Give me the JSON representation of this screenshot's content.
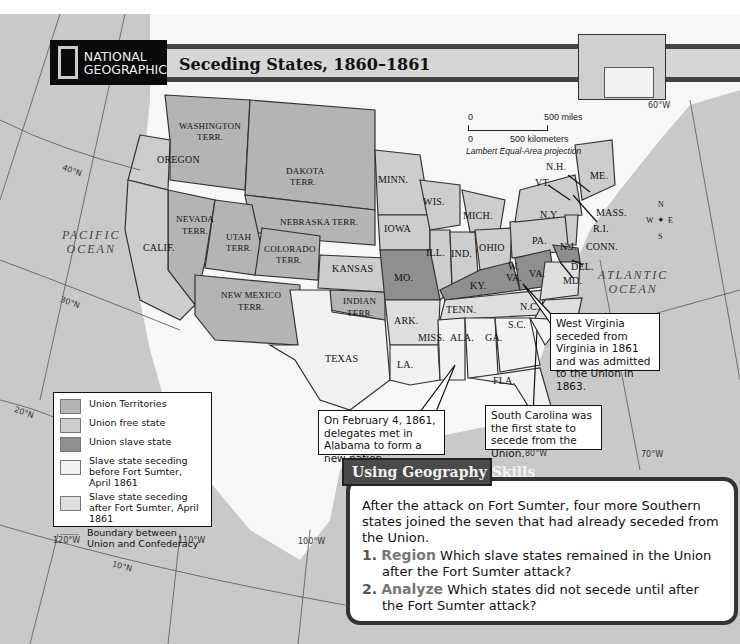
{
  "header": {
    "publisher_line1": "NATIONAL",
    "publisher_line2": "GEOGRAPHIC",
    "title": "Seceding States, 1860–1861"
  },
  "scale_bar": {
    "miles_start": "0",
    "miles_end": "500 miles",
    "km_start": "0",
    "km_end": "500 kilometers",
    "projection": "Lambert Equal-Area projection"
  },
  "compass": {
    "n": "N",
    "s": "S",
    "e": "E",
    "w": "W"
  },
  "oceans": {
    "pacific_line1": "PACIFIC",
    "pacific_line2": "OCEAN",
    "atlantic_line1": "ATLANTIC",
    "atlantic_line2": "OCEAN"
  },
  "gridlines": {
    "lat_40": "40°N",
    "lat_30": "30°N",
    "lat_20": "20°N",
    "lat_10": "10°N",
    "lon_120": "120°W",
    "lon_110": "110°W",
    "lon_100": "100°W",
    "lon_90": "90°W",
    "lon_80": "80°W",
    "lon_70": "70°W",
    "lon_60": "60°W"
  },
  "regions": {
    "washington_1": "WASHINGTON",
    "washington_2": "TERR.",
    "oregon": "OREGON",
    "dakota_1": "DAKOTA",
    "dakota_2": "TERR.",
    "nebraska": "NEBRASKA TERR.",
    "nevada_1": "NEVADA",
    "nevada_2": "TERR.",
    "utah_1": "UTAH",
    "utah_2": "TERR.",
    "colorado_1": "COLORADO",
    "colorado_2": "TERR.",
    "calif": "CALIF.",
    "kansas": "KANSAS",
    "newmexico_1": "NEW MEXICO",
    "newmexico_2": "TERR.",
    "indian_1": "INDIAN",
    "indian_2": "TERR.",
    "texas": "TEXAS",
    "minn": "MINN.",
    "wis": "WIS.",
    "iowa": "IOWA",
    "mich": "MICH.",
    "ill": "ILL.",
    "ind": "IND.",
    "ohio": "OHIO",
    "mo": "MO.",
    "ky": "KY.",
    "tenn": "TENN.",
    "ark": "ARK.",
    "miss": "MISS.",
    "ala": "ALA.",
    "ga": "GA.",
    "la": "LA.",
    "fla": "FLA.",
    "nc": "N.C.",
    "sc": "S.C.",
    "va": "VA.",
    "wva_1": "W.",
    "wva_2": "VA.",
    "md": "MD.",
    "del": "DEL.",
    "nj": "N.J.",
    "pa": "PA.",
    "ny": "N.Y.",
    "conn": "CONN.",
    "ri": "R.I.",
    "mass": "MASS.",
    "vt": "VT.",
    "nh": "N.H.",
    "me": "ME."
  },
  "callouts": {
    "west_virginia": "West Virginia seceded from Virginia in 1861 and was admitted to the Union in 1863.",
    "alabama": "On February 4, 1861, delegates met in Alabama to form a new nation.",
    "south_carolina": "South Carolina was the first state to secede from the Union."
  },
  "legend": {
    "items": [
      {
        "label": "Union Territories",
        "color": "#b4b4b4"
      },
      {
        "label": "Union free state",
        "color": "#cdcdcd"
      },
      {
        "label": "Union slave state",
        "color": "#8f8f8f"
      },
      {
        "label": "Slave state seceding before Fort Sumter, April 1861",
        "color": "#f2f2f2"
      },
      {
        "label": "Slave state seceding after Fort Sumter, April 1861",
        "color": "#dedede"
      },
      {
        "label": "Boundary between Union and Confederacy",
        "color": "#888888"
      }
    ]
  },
  "skills": {
    "heading": "Using Geography Skills",
    "intro": "After the attack on Fort Sumter, four more Southern states joined the seven that had already seceded from the Union.",
    "questions": [
      {
        "number": "1.",
        "keyword": "Region",
        "text": "Which slave states remained in the Union after the Fort Sumter attack?"
      },
      {
        "number": "2.",
        "keyword": "Analyze",
        "text": "Which states did not secede until after the Fort Sumter attack?"
      }
    ]
  },
  "colors": {
    "ocean": "#c9c9c9",
    "land_foreign": "#ffffff",
    "union_territory": "#b4b4b4",
    "union_free": "#cdcdcd",
    "union_slave": "#8f8f8f",
    "confed_before": "#f2f2f2",
    "confed_after": "#dedede"
  }
}
